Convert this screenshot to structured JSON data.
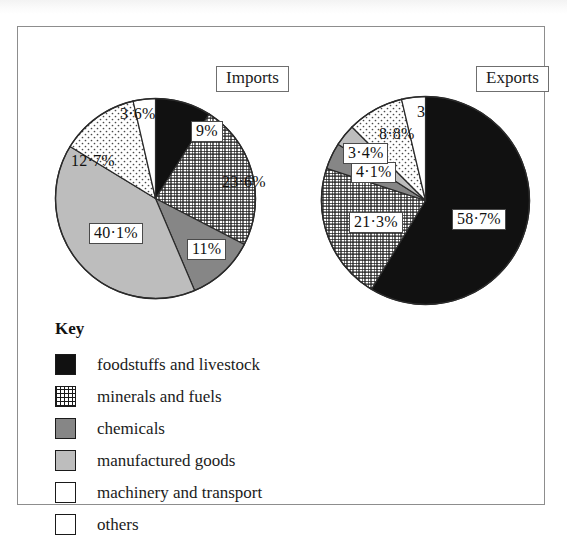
{
  "figure": {
    "charts": [
      {
        "id": "imports",
        "title": "Imports"
      },
      {
        "id": "exports",
        "title": "Exports"
      }
    ]
  },
  "key": {
    "heading": "Key",
    "items": [
      {
        "label": "foodstuffs and livestock",
        "swatch": "solid-black",
        "color": "#111111"
      },
      {
        "label": "minerals and fuels",
        "swatch": "cross-hatch",
        "color": "#1a1a1a"
      },
      {
        "label": "chemicals",
        "swatch": "solid-dark-gray",
        "color": "#868686"
      },
      {
        "label": "manufactured goods",
        "swatch": "solid-light-gray",
        "color": "#bdbdbd"
      },
      {
        "label": "machinery and transport",
        "swatch": "white",
        "color": "#ffffff"
      },
      {
        "label": "others",
        "swatch": "white",
        "color": "#ffffff"
      }
    ]
  },
  "labels": {
    "imports": {
      "foodstuffs": "9%",
      "minerals": "23·6%",
      "chemicals": "11%",
      "manufactured": "40·1%",
      "machinery": "12·7%",
      "others": "3·6%"
    },
    "exports": {
      "foodstuffs": "58·7%",
      "minerals": "21·3%",
      "chemicals": "4·1%",
      "manufactured": "3·4%",
      "machinery": "8·8%",
      "others": "3·7%"
    }
  },
  "chart_data": [
    {
      "type": "pie",
      "title": "Imports",
      "categories": [
        "foodstuffs and livestock",
        "minerals and fuels",
        "chemicals",
        "manufactured goods",
        "machinery and transport",
        "others"
      ],
      "values": [
        9.0,
        23.6,
        11.0,
        40.1,
        12.7,
        3.6
      ],
      "value_labels": [
        "9%",
        "23·6%",
        "11%",
        "40·1%",
        "12·7%",
        "3·6%"
      ],
      "fills": [
        "solid-black",
        "cross-hatch",
        "solid-dark-gray",
        "solid-light-gray",
        "stipple-dots",
        "white"
      ],
      "start_angle_deg": 0,
      "direction": "clockwise",
      "legend_position": "below"
    },
    {
      "type": "pie",
      "title": "Exports",
      "categories": [
        "foodstuffs and livestock",
        "minerals and fuels",
        "chemicals",
        "manufactured goods",
        "machinery and transport",
        "others"
      ],
      "values": [
        58.7,
        21.3,
        4.1,
        3.4,
        8.8,
        3.7
      ],
      "value_labels": [
        "58·7%",
        "21·3%",
        "4·1%",
        "3·4%",
        "8·8%",
        "3·7%"
      ],
      "fills": [
        "solid-black",
        "cross-hatch",
        "solid-dark-gray",
        "solid-light-gray",
        "stipple-dots",
        "white"
      ],
      "start_angle_deg": 0,
      "direction": "clockwise",
      "legend_position": "below"
    }
  ]
}
